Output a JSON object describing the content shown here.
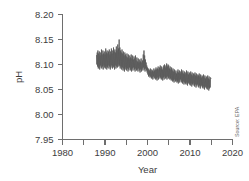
{
  "chart_data": {
    "type": "line",
    "title": "",
    "xlabel": "Year",
    "ylabel": "pH",
    "xlim": [
      1980,
      2020
    ],
    "ylim": [
      7.95,
      8.2
    ],
    "grid": false,
    "legend_position": "none",
    "x_ticks": [
      1980,
      1985,
      1990,
      1995,
      2000,
      2005,
      2010,
      2015,
      2020
    ],
    "x_tick_labels": [
      "1980",
      "",
      "1990",
      "",
      "2000",
      "",
      "2010",
      "",
      "2020"
    ],
    "y_ticks": [
      7.95,
      8.0,
      8.05,
      8.1,
      8.15,
      8.2
    ],
    "y_tick_labels": [
      "7.95",
      "8.00",
      "8.05",
      "8.10",
      "8.15",
      "8.20"
    ],
    "annotations": [
      {
        "text": "Source: EPA",
        "position": "bottom-right",
        "rotation": -90
      }
    ],
    "series": [
      {
        "name": "Ocean pH",
        "color": "#5a5a5a",
        "x": [
          1988.0,
          1988.08,
          1988.17,
          1988.25,
          1988.33,
          1988.42,
          1988.5,
          1988.58,
          1988.67,
          1988.75,
          1988.83,
          1988.92,
          1989.0,
          1989.08,
          1989.17,
          1989.25,
          1989.33,
          1989.42,
          1989.5,
          1989.58,
          1989.67,
          1989.75,
          1989.83,
          1989.92,
          1990.0,
          1990.08,
          1990.17,
          1990.25,
          1990.33,
          1990.42,
          1990.5,
          1990.58,
          1990.67,
          1990.75,
          1990.83,
          1990.92,
          1991.0,
          1991.08,
          1991.17,
          1991.25,
          1991.33,
          1991.42,
          1991.5,
          1991.58,
          1991.67,
          1991.75,
          1991.83,
          1991.92,
          1992.0,
          1992.08,
          1992.17,
          1992.25,
          1992.33,
          1992.42,
          1992.5,
          1992.58,
          1992.67,
          1992.75,
          1992.83,
          1992.92,
          1993.0,
          1993.08,
          1993.17,
          1993.25,
          1993.33,
          1993.42,
          1993.5,
          1993.58,
          1993.67,
          1993.75,
          1993.83,
          1993.92,
          1994.0,
          1994.08,
          1994.17,
          1994.25,
          1994.33,
          1994.42,
          1994.5,
          1994.58,
          1994.67,
          1994.75,
          1994.83,
          1994.92,
          1995.0,
          1995.08,
          1995.17,
          1995.25,
          1995.33,
          1995.42,
          1995.5,
          1995.58,
          1995.67,
          1995.75,
          1995.83,
          1995.92,
          1996.0,
          1996.08,
          1996.17,
          1996.25,
          1996.33,
          1996.42,
          1996.5,
          1996.58,
          1996.67,
          1996.75,
          1996.83,
          1996.92,
          1997.0,
          1997.08,
          1997.17,
          1997.25,
          1997.33,
          1997.42,
          1997.5,
          1997.58,
          1997.67,
          1997.75,
          1997.83,
          1997.92,
          1998.0,
          1998.08,
          1998.17,
          1998.25,
          1998.33,
          1998.42,
          1998.5,
          1998.58,
          1998.67,
          1998.75,
          1998.83,
          1998.92,
          1999.0,
          1999.08,
          1999.17,
          1999.25,
          1999.33,
          1999.42,
          1999.5,
          1999.58,
          1999.67,
          1999.75,
          1999.83,
          1999.92,
          2000.0,
          2000.08,
          2000.17,
          2000.25,
          2000.33,
          2000.42,
          2000.5,
          2000.58,
          2000.67,
          2000.75,
          2000.83,
          2000.92,
          2001.0,
          2001.08,
          2001.17,
          2001.25,
          2001.33,
          2001.42,
          2001.5,
          2001.58,
          2001.67,
          2001.75,
          2001.83,
          2001.92,
          2002.0,
          2002.08,
          2002.17,
          2002.25,
          2002.33,
          2002.42,
          2002.5,
          2002.58,
          2002.67,
          2002.75,
          2002.83,
          2002.92,
          2003.0,
          2003.08,
          2003.17,
          2003.25,
          2003.33,
          2003.42,
          2003.5,
          2003.58,
          2003.67,
          2003.75,
          2003.83,
          2003.92,
          2004.0,
          2004.08,
          2004.17,
          2004.25,
          2004.33,
          2004.42,
          2004.5,
          2004.58,
          2004.67,
          2004.75,
          2004.83,
          2004.92,
          2005.0,
          2005.08,
          2005.17,
          2005.25,
          2005.33,
          2005.42,
          2005.5,
          2005.58,
          2005.67,
          2005.75,
          2005.83,
          2005.92,
          2006.0,
          2006.08,
          2006.17,
          2006.25,
          2006.33,
          2006.42,
          2006.5,
          2006.58,
          2006.67,
          2006.75,
          2006.83,
          2006.92,
          2007.0,
          2007.08,
          2007.17,
          2007.25,
          2007.33,
          2007.42,
          2007.5,
          2007.58,
          2007.67,
          2007.75,
          2007.83,
          2007.92,
          2008.0,
          2008.08,
          2008.17,
          2008.25,
          2008.33,
          2008.42,
          2008.5,
          2008.58,
          2008.67,
          2008.75,
          2008.83,
          2008.92,
          2009.0,
          2009.08,
          2009.17,
          2009.25,
          2009.33,
          2009.42,
          2009.5,
          2009.58,
          2009.67,
          2009.75,
          2009.83,
          2009.92,
          2010.0,
          2010.08,
          2010.17,
          2010.25,
          2010.33,
          2010.42,
          2010.5,
          2010.58,
          2010.67,
          2010.75,
          2010.83,
          2010.92,
          2011.0,
          2011.08,
          2011.17,
          2011.25,
          2011.33,
          2011.42,
          2011.5,
          2011.58,
          2011.67,
          2011.75,
          2011.83,
          2011.92,
          2012.0,
          2012.08,
          2012.17,
          2012.25,
          2012.33,
          2012.42,
          2012.5,
          2012.58,
          2012.67,
          2012.75,
          2012.83,
          2012.92,
          2013.0,
          2013.08,
          2013.17,
          2013.25,
          2013.33,
          2013.42,
          2013.5,
          2013.58,
          2013.67,
          2013.75,
          2013.83,
          2013.92,
          2014.0,
          2014.08,
          2014.17,
          2014.25,
          2014.33,
          2014.42,
          2014.5,
          2014.58,
          2014.67,
          2014.75,
          2014.83,
          2014.92
        ],
        "y": [
          8.118,
          8.1,
          8.124,
          8.096,
          8.128,
          8.092,
          8.122,
          8.094,
          8.126,
          8.09,
          8.118,
          8.098,
          8.124,
          8.094,
          8.13,
          8.092,
          8.12,
          8.096,
          8.128,
          8.09,
          8.122,
          8.098,
          8.126,
          8.094,
          8.12,
          8.092,
          8.132,
          8.096,
          8.124,
          8.09,
          8.128,
          8.094,
          8.122,
          8.098,
          8.126,
          8.092,
          8.13,
          8.096,
          8.12,
          8.09,
          8.126,
          8.094,
          8.132,
          8.098,
          8.122,
          8.092,
          8.128,
          8.096,
          8.134,
          8.094,
          8.126,
          8.09,
          8.13,
          8.098,
          8.124,
          8.092,
          8.136,
          8.096,
          8.128,
          8.094,
          8.14,
          8.1,
          8.132,
          8.096,
          8.15,
          8.098,
          8.134,
          8.092,
          8.128,
          8.096,
          8.124,
          8.09,
          8.13,
          8.094,
          8.122,
          8.088,
          8.126,
          8.092,
          8.118,
          8.086,
          8.124,
          8.09,
          8.12,
          8.094,
          8.116,
          8.088,
          8.122,
          8.092,
          8.114,
          8.086,
          8.12,
          8.09,
          8.112,
          8.094,
          8.118,
          8.088,
          8.114,
          8.09,
          8.12,
          8.086,
          8.112,
          8.092,
          8.118,
          8.088,
          8.11,
          8.094,
          8.116,
          8.09,
          8.112,
          8.086,
          8.118,
          8.092,
          8.108,
          8.088,
          8.114,
          8.09,
          8.106,
          8.086,
          8.112,
          8.092,
          8.104,
          8.088,
          8.11,
          8.084,
          8.106,
          8.09,
          8.112,
          8.086,
          8.104,
          8.092,
          8.108,
          8.088,
          8.12,
          8.094,
          8.128,
          8.09,
          8.118,
          8.086,
          8.11,
          8.092,
          8.104,
          8.088,
          8.098,
          8.084,
          8.094,
          8.08,
          8.092,
          8.076,
          8.09,
          8.078,
          8.088,
          8.074,
          8.092,
          8.076,
          8.086,
          8.072,
          8.09,
          8.074,
          8.088,
          8.07,
          8.086,
          8.076,
          8.092,
          8.072,
          8.088,
          8.074,
          8.09,
          8.07,
          8.094,
          8.072,
          8.09,
          8.068,
          8.092,
          8.074,
          8.096,
          8.07,
          8.09,
          8.076,
          8.094,
          8.072,
          8.098,
          8.074,
          8.092,
          8.07,
          8.096,
          8.072,
          8.09,
          8.068,
          8.094,
          8.074,
          8.098,
          8.07,
          8.1,
          8.076,
          8.094,
          8.072,
          8.098,
          8.074,
          8.102,
          8.07,
          8.096,
          8.076,
          8.1,
          8.072,
          8.098,
          8.074,
          8.092,
          8.07,
          8.096,
          8.072,
          8.09,
          8.068,
          8.094,
          8.07,
          8.088,
          8.066,
          8.092,
          8.068,
          8.086,
          8.064,
          8.09,
          8.07,
          8.084,
          8.066,
          8.088,
          8.068,
          8.082,
          8.064,
          8.086,
          8.066,
          8.09,
          8.062,
          8.084,
          8.068,
          8.088,
          8.064,
          8.082,
          8.07,
          8.086,
          8.066,
          8.09,
          8.064,
          8.084,
          8.062,
          8.088,
          8.066,
          8.082,
          8.06,
          8.086,
          8.064,
          8.08,
          8.062,
          8.084,
          8.06,
          8.088,
          8.064,
          8.082,
          8.058,
          8.086,
          8.062,
          8.08,
          8.064,
          8.084,
          8.06,
          8.082,
          8.058,
          8.086,
          8.062,
          8.08,
          8.056,
          8.084,
          8.06,
          8.078,
          8.062,
          8.082,
          8.058,
          8.08,
          8.056,
          8.084,
          8.06,
          8.078,
          8.054,
          8.082,
          8.058,
          8.076,
          8.06,
          8.08,
          8.056,
          8.078,
          8.054,
          8.082,
          8.058,
          8.076,
          8.052,
          8.08,
          8.056,
          8.074,
          8.058,
          8.078,
          8.054,
          8.076,
          8.052,
          8.08,
          8.056,
          8.074,
          8.05,
          8.078,
          8.054,
          8.072,
          8.056,
          8.076,
          8.052,
          8.074,
          8.05,
          8.078,
          8.054,
          8.072,
          8.048,
          8.076,
          8.052,
          8.07,
          8.054,
          8.074,
          8.072
        ]
      }
    ]
  },
  "axes": {
    "y_title": "pH",
    "x_title": "Year"
  },
  "source": {
    "text": "Source: EPA"
  }
}
